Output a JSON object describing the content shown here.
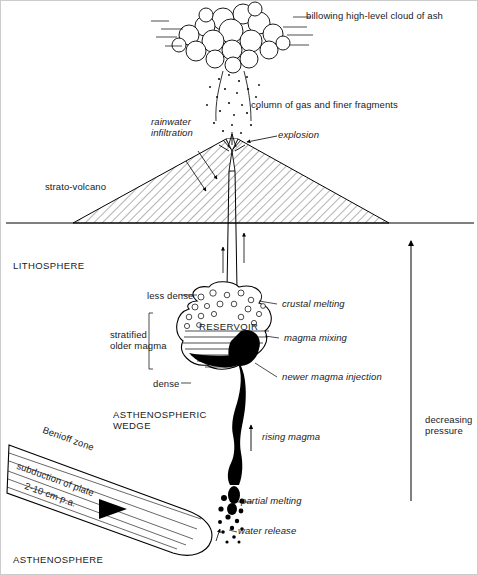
{
  "diagram": {
    "labels": {
      "billowing_cloud": "billowing high-level cloud of ash",
      "column": "column of gas and finer fragments",
      "rainwater": "rainwater\ninfiltration",
      "explosion": "explosion",
      "strato_volcano": "strato-volcano",
      "lithosphere": "LITHOSPHERE",
      "less_dense": "less dense",
      "crustal_melting": "crustal melting",
      "reservoir": "RESERVOIR",
      "magma_mixing": "magma mixing",
      "stratified_older_magma": "stratified\nolder magma",
      "dense": "dense",
      "newer_magma_injection": "newer magma injection",
      "asthenospheric_wedge": "ASTHENOSPHERIC\nWEDGE",
      "rising_magma": "rising magma",
      "decreasing_pressure": "decreasing\npressure",
      "benioff_zone": "Benioff zone",
      "subduction_of_plate": "subduction of plate",
      "subduction_rate": "2-10 cm p.a.",
      "partial_melting": "partial melting",
      "water_release": "water release",
      "asthenosphere": "ASTHENOSPHERE"
    },
    "colors": {
      "ink": "#000000",
      "background": "#ffffff",
      "magma_fill": "#000000"
    }
  }
}
